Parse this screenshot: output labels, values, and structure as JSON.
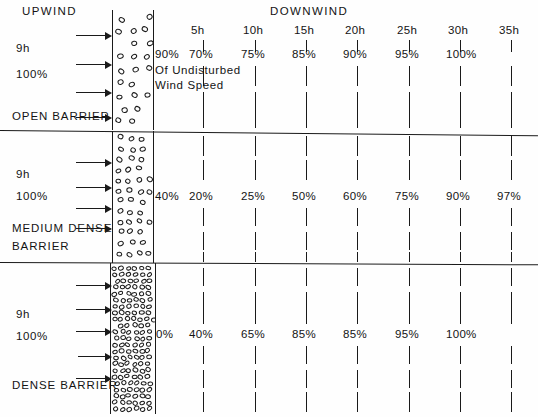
{
  "figure": {
    "upwind_label": "UPWIND",
    "downwind_label": "DOWNWIND",
    "height_label": "9h",
    "speed_label": "100%",
    "annotation_line1": "Of Undisturbed",
    "annotation_line2": "Wind Speed",
    "ink_color": "#1a1a1a",
    "background_color": "#fefefe"
  },
  "chart_data": {
    "type": "table",
    "xlabel": "Distance downwind (multiples of barrier height h)",
    "ylabel": "Percent of undisturbed wind speed",
    "annotation": "Of Undisturbed Wind Speed",
    "upwind": {
      "label": "UPWIND",
      "height": "9h",
      "speed": "100%"
    },
    "downwind_label": "DOWNWIND",
    "categories": [
      "5h",
      "10h",
      "15h",
      "20h",
      "25h",
      "30h",
      "35h"
    ],
    "station_positions_px": [
      203,
      255,
      306,
      357,
      409,
      460,
      511
    ],
    "barrier_face_label_x_px": 155,
    "series": [
      {
        "name": "OPEN BARRIER",
        "barrier_label": "OPEN BARRIER",
        "density": "open",
        "at_barrier": "90%",
        "values": [
          "70%",
          "75%",
          "85%",
          "90%",
          "95%",
          "100%",
          ""
        ],
        "numeric_values": [
          70,
          75,
          85,
          90,
          95,
          100,
          null
        ],
        "arrow_count": 4
      },
      {
        "name": "MEDIUM DENSE BARRIER",
        "barrier_label_line1": "MEDIUM DENSE",
        "barrier_label_line2": "BARRIER",
        "density": "medium",
        "at_barrier": "40%",
        "values": [
          "20%",
          "25%",
          "50%",
          "60%",
          "75%",
          "90%",
          "97%"
        ],
        "numeric_values": [
          20,
          25,
          50,
          60,
          75,
          90,
          97
        ],
        "arrow_count": 4
      },
      {
        "name": "DENSE BARRIER",
        "barrier_label": "DENSE BARRIER",
        "density": "dense",
        "at_barrier": "0%",
        "values": [
          "40%",
          "65%",
          "85%",
          "85%",
          "95%",
          "100%",
          ""
        ],
        "numeric_values": [
          40,
          65,
          85,
          85,
          95,
          100,
          null
        ],
        "arrow_count": 5
      }
    ]
  }
}
